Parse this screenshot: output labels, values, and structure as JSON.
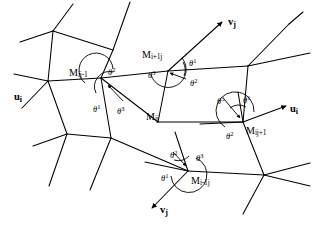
{
  "figure": {
    "background": "#ffffff",
    "line_color": "#000000",
    "width": 314,
    "height": 228
  },
  "nodes": [
    {
      "id": "Mij",
      "base": "M",
      "sub": "ij",
      "label": "M",
      "subscript": "ij",
      "x": 158,
      "y": 122,
      "label_x": 146,
      "label_y": 112
    },
    {
      "id": "Mij_1",
      "base": "M",
      "sub": "ij-1",
      "label": "M",
      "subscript": "ij-1",
      "x": 101,
      "y": 78,
      "label_x": 69,
      "label_y": 68
    },
    {
      "id": "Mi1j",
      "base": "M",
      "sub": "i+1j",
      "label": "M",
      "subscript": "i+1j",
      "x": 168,
      "y": 71,
      "label_x": 142,
      "label_y": 50
    },
    {
      "id": "Mij1",
      "base": "M",
      "sub": "ij+1",
      "label": "M",
      "subscript": "ij+1",
      "x": 243,
      "y": 122,
      "label_x": 246,
      "label_y": 126
    },
    {
      "id": "Mi_1j",
      "base": "M",
      "sub": "i-1j",
      "label": "M",
      "subscript": "i-1j",
      "x": 188,
      "y": 171,
      "label_x": 191,
      "label_y": 176
    }
  ],
  "angles": [
    {
      "at": "Mij_1",
      "symbol": "θ",
      "exponent": "2",
      "x": 108,
      "y": 67
    },
    {
      "at": "Mij_1",
      "symbol": "θ",
      "exponent": "1",
      "x": 93,
      "y": 104
    },
    {
      "at": "Mij_1",
      "symbol": "θ",
      "exponent": "3",
      "x": 117,
      "y": 106
    },
    {
      "at": "Mi1j",
      "symbol": "θ",
      "exponent": "1",
      "x": 189,
      "y": 58
    },
    {
      "at": "Mi1j",
      "symbol": "θ",
      "exponent": "2",
      "x": 190,
      "y": 78
    },
    {
      "at": "Mi1j",
      "symbol": "θ",
      "exponent": "3",
      "x": 148,
      "y": 70
    },
    {
      "at": "Mij1",
      "symbol": "θ",
      "exponent": "3",
      "x": 217,
      "y": 96
    },
    {
      "at": "Mij1",
      "symbol": "θ",
      "exponent": "1",
      "x": 243,
      "y": 95
    },
    {
      "at": "Mij1",
      "symbol": "θ",
      "exponent": "2",
      "x": 226,
      "y": 131
    },
    {
      "at": "Mi_1j",
      "symbol": "θ",
      "exponent": "2",
      "x": 170,
      "y": 150
    },
    {
      "at": "Mi_1j",
      "symbol": "θ",
      "exponent": "3",
      "x": 196,
      "y": 153
    },
    {
      "at": "Mi_1j",
      "symbol": "θ",
      "exponent": "1",
      "x": 161,
      "y": 173
    }
  ],
  "axis_labels": [
    {
      "id": "u-left",
      "base": "u",
      "sub": "i",
      "x": 14,
      "y": 92
    },
    {
      "id": "v-top",
      "base": "v",
      "sub": "j",
      "x": 228,
      "y": 17
    },
    {
      "id": "u-right",
      "base": "u",
      "sub": "i",
      "x": 290,
      "y": 104
    },
    {
      "id": "v-bottom",
      "base": "v",
      "sub": "j",
      "x": 160,
      "y": 205
    }
  ]
}
